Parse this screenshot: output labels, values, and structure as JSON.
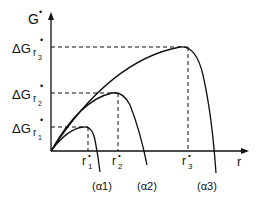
{
  "diagram": {
    "y_axis_label": "G",
    "x_axis_label": "r",
    "star": "•",
    "levels": [
      {
        "label_main": "ΔG",
        "label_sub": "r",
        "label_subsub": "1",
        "peak_label": "r",
        "peak_sub": "1"
      },
      {
        "label_main": "ΔG",
        "label_sub": "r",
        "label_subsub": "2",
        "peak_label": "r",
        "peak_sub": "2"
      },
      {
        "label_main": "ΔG",
        "label_sub": "r",
        "label_subsub": "3",
        "peak_label": "r",
        "peak_sub": "3"
      }
    ],
    "curve_labels": [
      "(α1)",
      "(α2)",
      "(α3)"
    ],
    "colors": {
      "line": "#111111",
      "background": "#ffffff"
    }
  }
}
